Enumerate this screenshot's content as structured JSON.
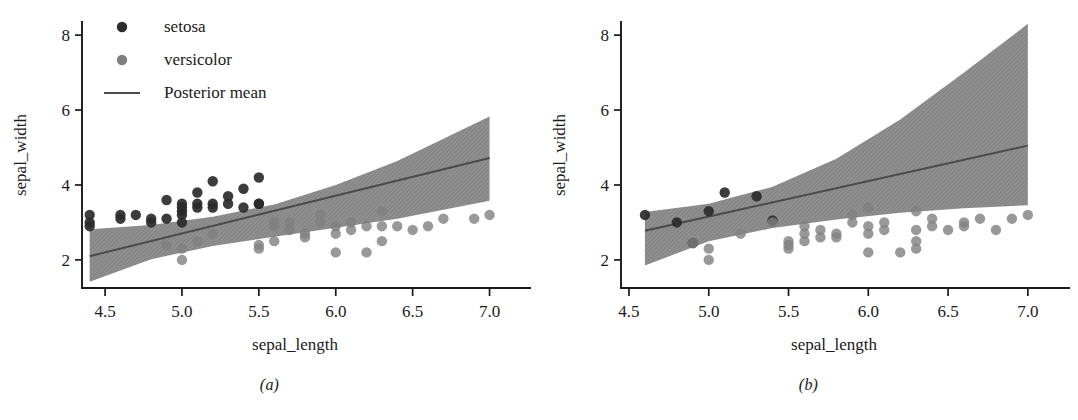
{
  "figure": {
    "panels": [
      {
        "caption": "(a)",
        "xlabel": "sepal_length",
        "ylabel": "sepal_width",
        "xticks": [
          "4.5",
          "5.0",
          "5.5",
          "6.0",
          "6.5",
          "7.0"
        ],
        "yticks": [
          "2",
          "4",
          "6",
          "8"
        ],
        "legend": {
          "visible": true,
          "entries": [
            {
              "label": "setosa",
              "marker": "circle",
              "color": "#2b2b2b"
            },
            {
              "label": "versicolor",
              "marker": "circle",
              "color": "#808080"
            },
            {
              "label": "Posterior mean",
              "marker": "line",
              "color": "#4a4a4a"
            }
          ]
        }
      },
      {
        "caption": "(b)",
        "xlabel": "sepal_length",
        "ylabel": "sepal_width",
        "xticks": [
          "4.5",
          "5.0",
          "5.5",
          "6.0",
          "6.5",
          "7.0"
        ],
        "yticks": [
          "2",
          "4",
          "6",
          "8"
        ],
        "legend": {
          "visible": false,
          "entries": []
        }
      }
    ]
  },
  "chart_data": [
    {
      "type": "scatter",
      "title": "",
      "subtitle": "(a)",
      "xlabel": "sepal_length",
      "ylabel": "sepal_width",
      "xlim": [
        4.35,
        7.12
      ],
      "ylim": [
        1.25,
        8.35
      ],
      "xticks": [
        4.5,
        5.0,
        5.5,
        6.0,
        6.5,
        7.0
      ],
      "yticks": [
        2,
        4,
        6,
        8
      ],
      "grid": false,
      "legend_position": "upper-left",
      "series": [
        {
          "name": "setosa",
          "type": "scatter",
          "color": "#2b2b2b",
          "points": [
            [
              4.4,
              3.2
            ],
            [
              4.4,
              3.0
            ],
            [
              4.4,
              2.9
            ],
            [
              4.6,
              3.2
            ],
            [
              4.6,
              3.1
            ],
            [
              4.7,
              3.2
            ],
            [
              4.8,
              3.1
            ],
            [
              4.8,
              3.0
            ],
            [
              4.9,
              3.6
            ],
            [
              4.9,
              3.1
            ],
            [
              5.0,
              3.5
            ],
            [
              5.0,
              3.4
            ],
            [
              5.0,
              3.3
            ],
            [
              5.0,
              3.2
            ],
            [
              5.0,
              3.0
            ],
            [
              5.1,
              3.8
            ],
            [
              5.1,
              3.5
            ],
            [
              5.1,
              3.4
            ],
            [
              5.2,
              4.1
            ],
            [
              5.2,
              3.5
            ],
            [
              5.2,
              3.4
            ],
            [
              5.3,
              3.7
            ],
            [
              5.3,
              3.5
            ],
            [
              5.4,
              3.4
            ],
            [
              5.4,
              3.9
            ],
            [
              5.5,
              4.2
            ],
            [
              5.5,
              3.5
            ],
            [
              5.5,
              3.5
            ]
          ]
        },
        {
          "name": "versicolor",
          "type": "scatter",
          "color": "#808080",
          "points": [
            [
              4.9,
              2.4
            ],
            [
              5.0,
              2.0
            ],
            [
              5.0,
              2.3
            ],
            [
              5.1,
              2.5
            ],
            [
              5.2,
              2.7
            ],
            [
              5.5,
              2.3
            ],
            [
              5.5,
              2.4
            ],
            [
              5.6,
              3.0
            ],
            [
              5.6,
              2.5
            ],
            [
              5.6,
              2.9
            ],
            [
              5.7,
              2.8
            ],
            [
              5.7,
              3.0
            ],
            [
              5.8,
              2.7
            ],
            [
              5.8,
              2.6
            ],
            [
              5.9,
              3.2
            ],
            [
              5.9,
              3.0
            ],
            [
              6.0,
              2.2
            ],
            [
              6.0,
              2.9
            ],
            [
              6.0,
              2.7
            ],
            [
              6.1,
              2.8
            ],
            [
              6.1,
              3.0
            ],
            [
              6.2,
              2.2
            ],
            [
              6.2,
              2.9
            ],
            [
              6.3,
              3.3
            ],
            [
              6.3,
              2.5
            ],
            [
              6.3,
              2.9
            ],
            [
              6.4,
              2.9
            ],
            [
              6.5,
              2.8
            ],
            [
              6.6,
              2.9
            ],
            [
              6.7,
              3.1
            ],
            [
              6.9,
              3.1
            ],
            [
              7.0,
              3.2
            ]
          ]
        },
        {
          "name": "Posterior mean",
          "type": "line",
          "color": "#4a4a4a",
          "x": [
            4.4,
            7.0
          ],
          "y": [
            2.1,
            4.72
          ]
        },
        {
          "name": "credible band",
          "type": "band",
          "color": "#8a8a8a",
          "x": [
            4.4,
            4.8,
            5.2,
            5.6,
            6.0,
            6.4,
            7.0
          ],
          "lower": [
            1.42,
            2.02,
            2.37,
            2.62,
            2.86,
            3.1,
            3.58
          ],
          "upper": [
            2.82,
            2.93,
            3.15,
            3.48,
            4.0,
            4.64,
            5.83
          ]
        }
      ]
    },
    {
      "type": "scatter",
      "title": "",
      "subtitle": "(b)",
      "xlabel": "sepal_length",
      "ylabel": "sepal_width",
      "xlim": [
        4.45,
        7.12
      ],
      "ylim": [
        1.25,
        8.35
      ],
      "xticks": [
        4.5,
        5.0,
        5.5,
        6.0,
        6.5,
        7.0
      ],
      "yticks": [
        2,
        4,
        6,
        8
      ],
      "grid": false,
      "legend_position": "none",
      "series": [
        {
          "name": "setosa",
          "type": "scatter",
          "color": "#2b2b2b",
          "points": [
            [
              4.6,
              3.2
            ],
            [
              4.8,
              3.0
            ],
            [
              4.9,
              2.45
            ],
            [
              5.0,
              3.3
            ],
            [
              5.1,
              3.8
            ],
            [
              5.3,
              3.7
            ],
            [
              5.4,
              3.05
            ]
          ]
        },
        {
          "name": "versicolor",
          "type": "scatter",
          "color": "#808080",
          "points": [
            [
              4.9,
              2.45
            ],
            [
              5.0,
              2.3
            ],
            [
              5.0,
              2.0
            ],
            [
              5.2,
              2.7
            ],
            [
              5.4,
              3.0
            ],
            [
              5.5,
              2.5
            ],
            [
              5.5,
              2.4
            ],
            [
              5.5,
              2.3
            ],
            [
              5.6,
              2.9
            ],
            [
              5.6,
              2.7
            ],
            [
              5.6,
              2.5
            ],
            [
              5.7,
              2.8
            ],
            [
              5.7,
              2.6
            ],
            [
              5.8,
              2.7
            ],
            [
              5.8,
              2.6
            ],
            [
              5.9,
              3.2
            ],
            [
              5.9,
              3.0
            ],
            [
              6.0,
              3.4
            ],
            [
              6.0,
              2.9
            ],
            [
              6.0,
              2.7
            ],
            [
              6.0,
              2.2
            ],
            [
              6.1,
              3.0
            ],
            [
              6.1,
              2.8
            ],
            [
              6.2,
              2.2
            ],
            [
              6.3,
              3.3
            ],
            [
              6.3,
              2.8
            ],
            [
              6.3,
              2.5
            ],
            [
              6.3,
              2.3
            ],
            [
              6.4,
              3.1
            ],
            [
              6.4,
              2.9
            ],
            [
              6.5,
              2.8
            ],
            [
              6.6,
              3.0
            ],
            [
              6.6,
              2.9
            ],
            [
              6.7,
              3.1
            ],
            [
              6.8,
              2.8
            ],
            [
              6.9,
              3.1
            ],
            [
              7.0,
              3.2
            ]
          ]
        },
        {
          "name": "Posterior mean",
          "type": "line",
          "color": "#4a4a4a",
          "x": [
            4.6,
            7.0
          ],
          "y": [
            2.78,
            5.05
          ]
        },
        {
          "name": "credible band",
          "type": "band",
          "color": "#8a8a8a",
          "x": [
            4.6,
            5.0,
            5.4,
            5.8,
            6.2,
            6.6,
            7.0
          ],
          "lower": [
            1.85,
            2.5,
            2.85,
            3.08,
            3.26,
            3.38,
            3.46
          ],
          "upper": [
            3.28,
            3.5,
            3.95,
            4.7,
            5.75,
            7.0,
            8.3
          ]
        }
      ]
    }
  ]
}
